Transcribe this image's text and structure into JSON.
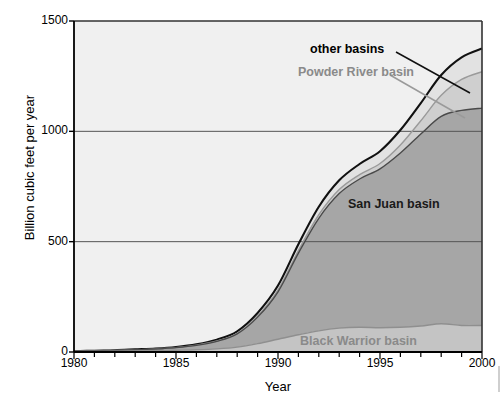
{
  "chart_data": {
    "type": "area",
    "stacked": true,
    "title": "",
    "subtitle": "",
    "xlabel": "Year",
    "ylabel": "Billion cubic feet per year",
    "xlim": [
      1980,
      2000
    ],
    "ylim": [
      0,
      1500
    ],
    "xticks": [
      1980,
      1985,
      1990,
      1995,
      2000
    ],
    "xtick_labels": [
      "1980",
      "1985",
      "1990",
      "1995",
      "2000"
    ],
    "xtick_minor_every": 1,
    "yticks": [
      0,
      500,
      1000,
      1500
    ],
    "ytick_labels": [
      "0",
      "500",
      "1000",
      "1500"
    ],
    "grid": "horizontal",
    "legend_position": "inline-annotations",
    "x": [
      1980,
      1981,
      1982,
      1983,
      1984,
      1985,
      1986,
      1987,
      1988,
      1989,
      1990,
      1991,
      1992,
      1993,
      1994,
      1995,
      1996,
      1997,
      1998,
      1999,
      2000
    ],
    "series": [
      {
        "name": "Black Warrior basin",
        "color": "#c4c4c4",
        "line_color": "#8f8f8f",
        "values": [
          2,
          3,
          4,
          5,
          6,
          8,
          10,
          14,
          22,
          38,
          58,
          78,
          96,
          108,
          112,
          110,
          112,
          118,
          128,
          120,
          120
        ]
      },
      {
        "name": "San Juan basin",
        "color": "#a6a6a6",
        "line_color": "#4a4a4a",
        "values": [
          1,
          2,
          3,
          5,
          8,
          12,
          20,
          34,
          60,
          120,
          215,
          370,
          510,
          610,
          672,
          720,
          790,
          870,
          940,
          975,
          985
        ]
      },
      {
        "name": "Powder River basin",
        "color": "#cfcfcf",
        "line_color": "#9a9a9a",
        "values": [
          0,
          0,
          0,
          0,
          0,
          0,
          1,
          2,
          3,
          5,
          8,
          12,
          16,
          18,
          20,
          24,
          36,
          60,
          95,
          140,
          165
        ]
      },
      {
        "name": "other basins",
        "color": "#e2e2e2",
        "line_color": "#111111",
        "values": [
          0,
          1,
          1,
          2,
          2,
          3,
          4,
          6,
          9,
          14,
          20,
          28,
          36,
          42,
          48,
          56,
          68,
          80,
          92,
          100,
          105
        ]
      }
    ],
    "annotations": [
      {
        "label": "other basins",
        "style": "bold-black"
      },
      {
        "label": "Powder River basin",
        "style": "bold-gray"
      },
      {
        "label": "San Juan basin",
        "style": "bold-black"
      },
      {
        "label": "Black Warrior basin",
        "style": "bold-gray"
      }
    ],
    "plot_background": "#f0f0f0",
    "axis_color": "#333333",
    "gridline_color": "#555555"
  }
}
